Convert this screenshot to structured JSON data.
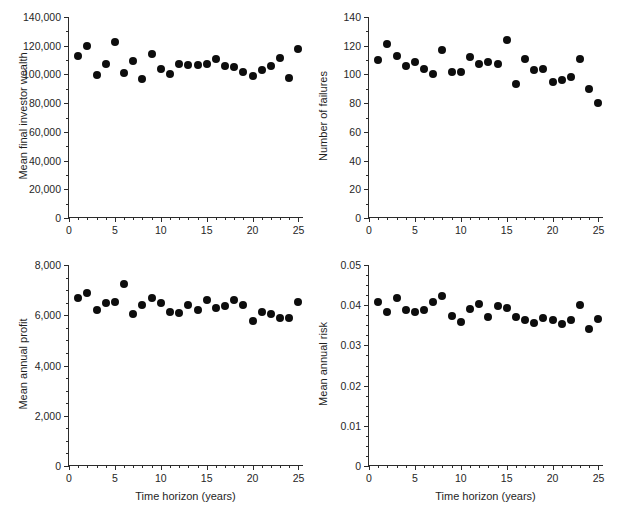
{
  "figure": {
    "background": "#ffffff",
    "marker_color": "#0d0d0d",
    "axis_color": "#2b2b2b",
    "shared_xlabel": "Time horizon (years)"
  },
  "chart_data": [
    {
      "id": "mean-final-investor-wealth",
      "type": "scatter",
      "title": "",
      "xlabel": "",
      "ylabel": "Mean final investor wealth",
      "xlim": [
        0,
        25.6
      ],
      "ylim": [
        0,
        140000
      ],
      "xticks": [
        0,
        5,
        10,
        15,
        20,
        25
      ],
      "xtick_labels": [
        "0",
        "5",
        "10",
        "15",
        "20",
        "25"
      ],
      "yticks": [
        0,
        20000,
        40000,
        60000,
        80000,
        100000,
        120000,
        140000
      ],
      "ytick_labels": [
        "0",
        "20,000",
        "40,000",
        "60,000",
        "80,000",
        "100,000",
        "120,000",
        "140,000"
      ],
      "xminor_step": 1,
      "yminor_step": 10000,
      "grid": false,
      "legend": null,
      "x": [
        1,
        2,
        3,
        4,
        5,
        6,
        7,
        8,
        9,
        10,
        11,
        12,
        13,
        14,
        15,
        16,
        17,
        18,
        19,
        20,
        21,
        22,
        23,
        24,
        25
      ],
      "y": [
        113000,
        119500,
        99300,
        107300,
        122800,
        101200,
        109500,
        96800,
        114200,
        104000,
        100400,
        107000,
        106300,
        106900,
        107500,
        110600,
        106000,
        105200,
        102000,
        98900,
        103200,
        106200,
        111100,
        97300,
        117500
      ]
    },
    {
      "id": "number-of-failures",
      "type": "scatter",
      "title": "",
      "xlabel": "",
      "ylabel": "Number of failures",
      "xlim": [
        0,
        25.6
      ],
      "ylim": [
        0,
        140
      ],
      "xticks": [
        0,
        5,
        10,
        15,
        20,
        25
      ],
      "xtick_labels": [
        "0",
        "5",
        "10",
        "15",
        "20",
        "25"
      ],
      "yticks": [
        0,
        20,
        40,
        60,
        80,
        100,
        120,
        140
      ],
      "ytick_labels": [
        "0",
        "20",
        "40",
        "60",
        "80",
        "100",
        "120",
        "140"
      ],
      "xminor_step": 1,
      "yminor_step": 10,
      "grid": false,
      "legend": null,
      "x": [
        1,
        2,
        3,
        4,
        5,
        6,
        7,
        8,
        9,
        10,
        11,
        12,
        13,
        14,
        15,
        16,
        17,
        18,
        19,
        20,
        21,
        22,
        23,
        24,
        25
      ],
      "y": [
        110,
        121,
        113,
        106,
        109,
        103.5,
        100.5,
        117,
        102,
        101.5,
        112,
        107,
        108.5,
        107.5,
        124,
        93,
        110.5,
        103,
        104,
        95,
        96,
        98,
        110.5,
        90,
        80
      ]
    },
    {
      "id": "mean-annual-profit",
      "type": "scatter",
      "title": "",
      "xlabel": "Time horizon (years)",
      "ylabel": "Mean annual profit",
      "xlim": [
        0,
        25.6
      ],
      "ylim": [
        0,
        8000
      ],
      "xticks": [
        0,
        5,
        10,
        15,
        20,
        25
      ],
      "xtick_labels": [
        "0",
        "5",
        "10",
        "15",
        "20",
        "25"
      ],
      "yticks": [
        0,
        2000,
        4000,
        6000,
        8000
      ],
      "ytick_labels": [
        "0",
        "2,000",
        "4,000",
        "6,000",
        "8,000"
      ],
      "xminor_step": 1,
      "yminor_step": 500,
      "grid": false,
      "legend": null,
      "x": [
        1,
        2,
        3,
        4,
        5,
        6,
        7,
        8,
        9,
        10,
        11,
        12,
        13,
        14,
        15,
        16,
        17,
        18,
        19,
        20,
        21,
        22,
        23,
        24,
        25
      ],
      "y": [
        6700,
        6870,
        6190,
        6490,
        6510,
        7230,
        6060,
        6400,
        6690,
        6500,
        6120,
        6100,
        6400,
        6210,
        6600,
        6300,
        6370,
        6620,
        6400,
        5790,
        6140,
        6060,
        5910,
        5910,
        6520
      ]
    },
    {
      "id": "mean-annual-risk",
      "type": "scatter",
      "title": "",
      "xlabel": "Time horizon (years)",
      "ylabel": "Mean annual risk",
      "xlim": [
        0,
        25.6
      ],
      "ylim": [
        0,
        0.05
      ],
      "xticks": [
        0,
        5,
        10,
        15,
        20,
        25
      ],
      "xtick_labels": [
        "0",
        "5",
        "10",
        "15",
        "20",
        "25"
      ],
      "yticks": [
        0,
        0.01,
        0.02,
        0.03,
        0.04,
        0.05
      ],
      "ytick_labels": [
        "0",
        "0.01",
        "0.02",
        "0.03",
        "0.04",
        "0.05"
      ],
      "xminor_step": 1,
      "yminor_step": 0.0025,
      "grid": false,
      "legend": null,
      "x": [
        1,
        2,
        3,
        4,
        5,
        6,
        7,
        8,
        9,
        10,
        11,
        12,
        13,
        14,
        15,
        16,
        17,
        18,
        19,
        20,
        21,
        22,
        23,
        24,
        25
      ],
      "y": [
        0.0409,
        0.0382,
        0.0418,
        0.0388,
        0.0383,
        0.0388,
        0.0407,
        0.0423,
        0.0372,
        0.0357,
        0.039,
        0.0404,
        0.0371,
        0.0398,
        0.0394,
        0.037,
        0.0363,
        0.0356,
        0.0368,
        0.0363,
        0.0353,
        0.0362,
        0.04,
        0.034,
        0.0366
      ]
    }
  ],
  "panels": [
    {
      "key": "mean-final-investor-wealth",
      "name": "panel-mean-final-investor-wealth",
      "left": 0,
      "top": 0,
      "width": 310,
      "height": 254,
      "plot_left": 68,
      "plot_top": 17,
      "plot_width": 235,
      "plot_height": 201,
      "show_xlabel": false
    },
    {
      "key": "number-of-failures",
      "name": "panel-number-of-failures",
      "left": 310,
      "top": 0,
      "width": 310,
      "height": 254,
      "plot_left": 58,
      "plot_top": 17,
      "plot_width": 235,
      "plot_height": 201,
      "show_xlabel": false
    },
    {
      "key": "mean-annual-profit",
      "name": "panel-mean-annual-profit",
      "left": 0,
      "top": 254,
      "width": 310,
      "height": 253,
      "plot_left": 68,
      "plot_top": 11,
      "plot_width": 235,
      "plot_height": 201,
      "show_xlabel": true
    },
    {
      "key": "mean-annual-risk",
      "name": "panel-mean-annual-risk",
      "left": 310,
      "top": 254,
      "width": 310,
      "height": 253,
      "plot_left": 58,
      "plot_top": 11,
      "plot_width": 235,
      "plot_height": 201,
      "show_xlabel": true
    }
  ]
}
